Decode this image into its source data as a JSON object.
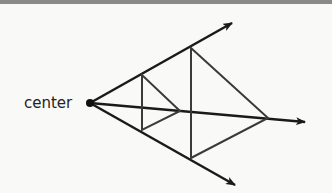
{
  "diagram": {
    "center_label": "center",
    "center": [
      90,
      103
    ],
    "rays": [
      {
        "name": "upper",
        "end": [
          232,
          23
        ]
      },
      {
        "name": "middle",
        "end": [
          305,
          122
        ]
      },
      {
        "name": "lower",
        "end": [
          235,
          185
        ]
      }
    ],
    "small_triangle": [
      [
        142,
        75
      ],
      [
        142,
        130
      ],
      [
        180,
        111
      ]
    ],
    "large_triangle": [
      [
        191,
        48
      ],
      [
        191,
        158
      ],
      [
        268,
        118
      ]
    ],
    "colors": {
      "ray": "#1a1a1a",
      "triangle": "#3a3a3a",
      "background": "#f9f9f8"
    }
  }
}
